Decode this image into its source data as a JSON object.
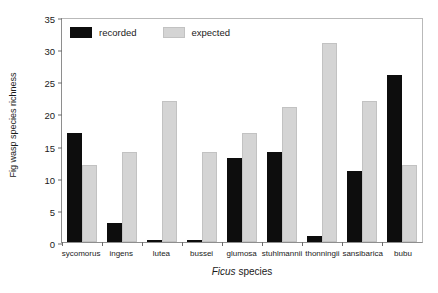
{
  "chart_data": {
    "type": "bar",
    "title": "",
    "subtitle": "",
    "xlabel": "Ficus species",
    "xlabel_italic_part": "Ficus",
    "xlabel_plain_part": " species",
    "ylabel": "Fig wasp species richness",
    "ylim": [
      0,
      35
    ],
    "ytick_step": 5,
    "yticks": [
      0,
      5,
      10,
      15,
      20,
      25,
      30,
      35
    ],
    "ytick_labels": [
      "0",
      "5",
      "10",
      "15",
      "20",
      "25",
      "30",
      "35"
    ],
    "grid": false,
    "legend_position": "top-left-inside",
    "categories": [
      "sycomorus",
      "ingens",
      "lutea",
      "bussei",
      "glumosa",
      "stuhlmannii",
      "thonningii",
      "sansibarica",
      "bubu"
    ],
    "series": [
      {
        "name": "recorded",
        "color": "#0d0d0d",
        "values": [
          17,
          3,
          0.3,
          0.3,
          13,
          14,
          1,
          11,
          26
        ]
      },
      {
        "name": "expected",
        "color": "#d4d4d4",
        "values": [
          12,
          14,
          22,
          14,
          17,
          21,
          31,
          22,
          12
        ]
      }
    ]
  },
  "legend": {
    "items": [
      {
        "label": "recorded",
        "swatch": "recorded"
      },
      {
        "label": "expected",
        "swatch": "expected"
      }
    ]
  },
  "colors": {
    "recorded": "#0d0d0d",
    "expected": "#d4d4d4",
    "axis": "#8e8e8e",
    "frame": "#b9b9b9",
    "text": "#1a1a1a",
    "background": "#ffffff"
  }
}
